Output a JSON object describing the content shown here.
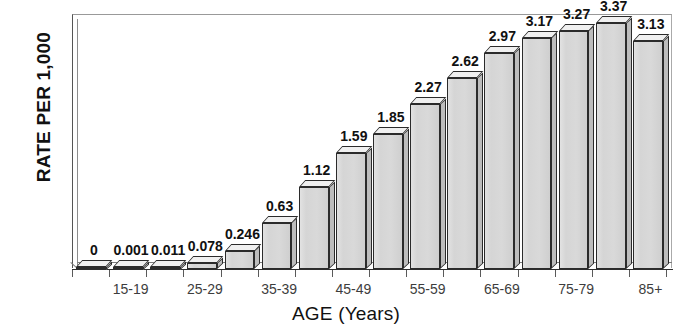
{
  "chart_data": {
    "type": "bar",
    "title": "",
    "xlabel": "AGE (Years)",
    "ylabel": "RATE PER 1,000",
    "ylim": [
      0,
      3.5
    ],
    "ytick_labels": [
      "0",
      "0.5",
      "1",
      "1.5",
      "2",
      "2.5",
      "3",
      "3.5"
    ],
    "ytick_values": [
      0,
      0.5,
      1,
      1.5,
      2,
      2.5,
      3,
      3.5
    ],
    "grid": false,
    "legend": null,
    "categories": [
      "10-14",
      "15-19",
      "20-24",
      "25-29",
      "30-34",
      "35-39",
      "40-44",
      "45-49",
      "50-54",
      "55-59",
      "60-64",
      "65-69",
      "70-74",
      "75-79",
      "80-84",
      "85+"
    ],
    "xtick_labels_visible": [
      "15-19",
      "25-29",
      "35-39",
      "45-49",
      "55-59",
      "65-69",
      "75-79",
      "85+"
    ],
    "values": [
      0,
      0.001,
      0.011,
      0.078,
      0.246,
      0.63,
      1.12,
      1.59,
      1.85,
      2.27,
      2.62,
      2.97,
      3.17,
      3.27,
      3.37,
      3.13
    ],
    "data_labels": [
      "0",
      "0.001",
      "0.011",
      "0.078",
      "0.246",
      "0.63",
      "1.12",
      "1.59",
      "1.85",
      "2.27",
      "2.62",
      "2.97",
      "3.17",
      "3.27",
      "3.37",
      "3.13"
    ],
    "colors": {
      "bar_face": "#d5d5d5",
      "bar_top": "#f0f0f0",
      "bar_side": "#bdbdbd",
      "bar_outline": "#2b2b2b",
      "axis": "#2e2e2e",
      "text": "#111111",
      "tick_text": "#3d3d3d",
      "background": "#ffffff"
    }
  }
}
